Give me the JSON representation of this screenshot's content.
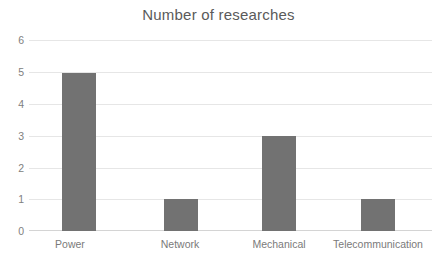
{
  "chart_data": {
    "type": "bar",
    "title": "Number of researches",
    "xlabel": "",
    "ylabel": "",
    "categories": [
      "Power",
      "Network",
      "Mechanical",
      "Telecommunication"
    ],
    "values": [
      5,
      1,
      3,
      1
    ],
    "ylim": [
      0,
      6
    ],
    "yticks": [
      "0",
      "1",
      "2",
      "3",
      "4",
      "5",
      "6"
    ],
    "grid": true,
    "legend": false,
    "colors": {
      "bar": "#727272",
      "gridline": "#e6e6e6",
      "axis": "#d4d4d4",
      "title_text": "#5a5a5a",
      "tick_text": "#808080",
      "category_text": "#7a7a7a",
      "background": "#ffffff"
    }
  }
}
